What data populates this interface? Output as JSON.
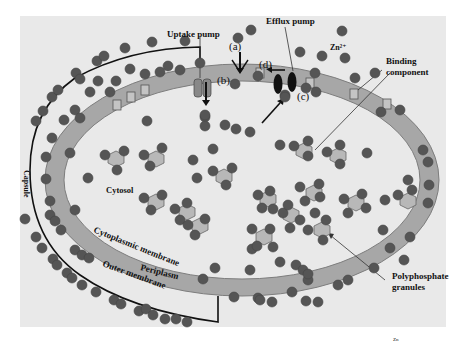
{
  "figure": {
    "colors": {
      "panel": "#e9e9e9",
      "periplasm": "#a7a7a7",
      "periplasm_edge": "#7d7d7d",
      "ion": "#5a5a5a",
      "polyphosphate": "#b8b8b8",
      "binding_box": "#c4c4c4",
      "line": "#111111"
    }
  },
  "labels": {
    "uptake_pump": "Uptake pump",
    "efflux_pump": "Efflux pump",
    "zinc_ion": "Zn²⁺",
    "binding_component_line1": "Binding",
    "binding_component_line2": "component",
    "cytosol": "Cytosol",
    "capsule": "Capsule",
    "cytoplasmic_membrane": "Cytoplasmic membrane",
    "periplasm": "Periplasm",
    "outer_membrane": "Outer membrane",
    "polyphosphate_line1": "Polyphosphate",
    "polyphosphate_line2": "granules",
    "marker_a": "(a)",
    "marker_b": "(b)",
    "marker_c": "(c)",
    "marker_d": "(d)",
    "footnote": "Zn"
  }
}
